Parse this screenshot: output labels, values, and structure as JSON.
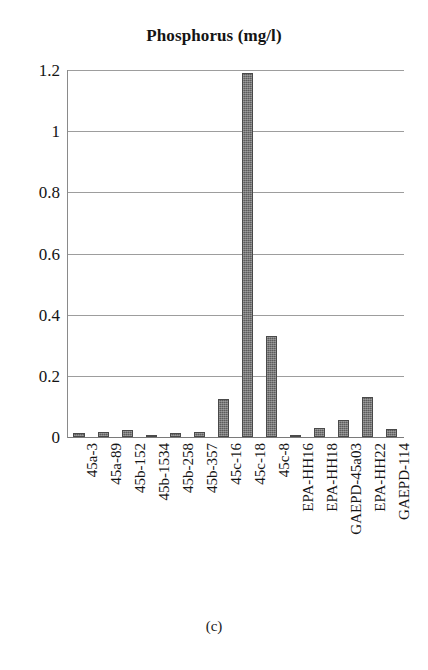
{
  "figure": {
    "caption": "(c)"
  },
  "chart_data": {
    "type": "bar",
    "title": "Phosphorus (mg/l)",
    "xlabel": "",
    "ylabel": "",
    "ylim": [
      0,
      1.2
    ],
    "yticks": [
      "0",
      "0.2",
      "0.4",
      "0.6",
      "0.8",
      "1",
      "1.2"
    ],
    "ytick_values": [
      0,
      0.2,
      0.4,
      0.6,
      0.8,
      1,
      1.2
    ],
    "grid": true,
    "legend": false,
    "bar_color": "#5c5c5c",
    "categories": [
      "45a-3",
      "45a-89",
      "45b-152",
      "45b-1534",
      "45b-258",
      "45b-357",
      "45c-16",
      "45c-18",
      "45c-8",
      "EPA-HH16",
      "EPA-HH18",
      "GAEPD-45a03",
      "EPA-HH22",
      "GAEPD-114"
    ],
    "values": [
      0.012,
      0.018,
      0.022,
      0.008,
      0.014,
      0.016,
      0.125,
      1.19,
      0.33,
      0.008,
      0.03,
      0.055,
      0.13,
      0.025
    ]
  }
}
